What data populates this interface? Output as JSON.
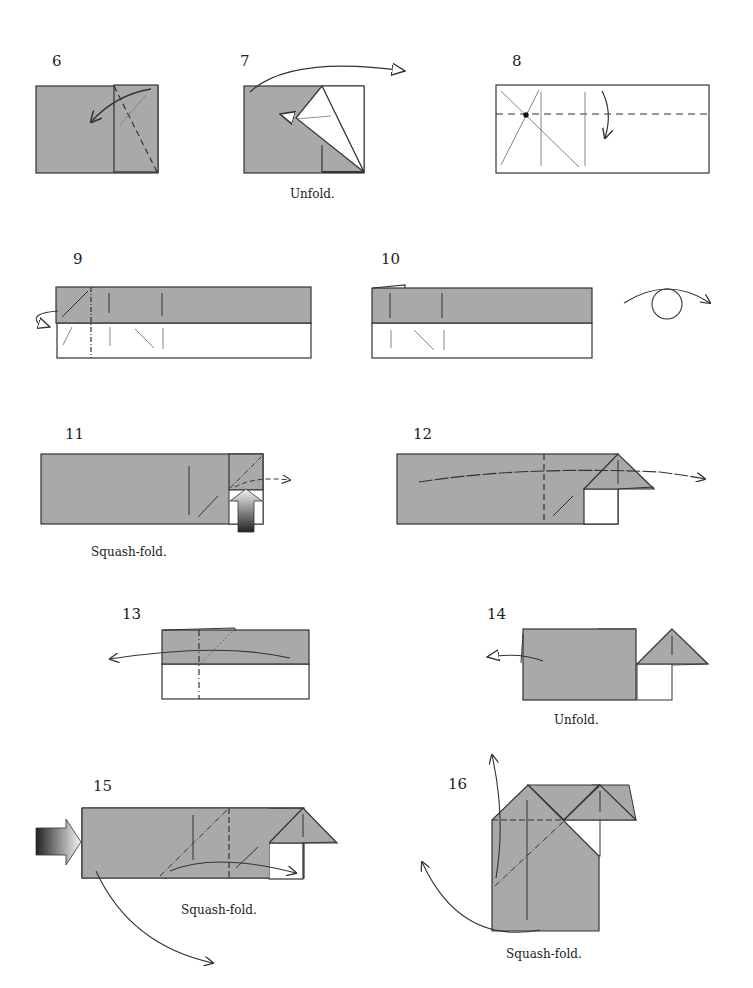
{
  "colors": {
    "paper_gray": "#a9a9a9",
    "paper_white": "#ffffff",
    "line": "#333333",
    "crease": "#777777"
  },
  "steps": [
    {
      "number": "6",
      "caption": ""
    },
    {
      "number": "7",
      "caption": "Unfold."
    },
    {
      "number": "8",
      "caption": ""
    },
    {
      "number": "9",
      "caption": ""
    },
    {
      "number": "10",
      "caption": ""
    },
    {
      "number": "11",
      "caption": "Squash-fold."
    },
    {
      "number": "12",
      "caption": ""
    },
    {
      "number": "13",
      "caption": ""
    },
    {
      "number": "14",
      "caption": "Unfold."
    },
    {
      "number": "15",
      "caption": "Squash-fold."
    },
    {
      "number": "16",
      "caption": "Squash-fold."
    }
  ]
}
